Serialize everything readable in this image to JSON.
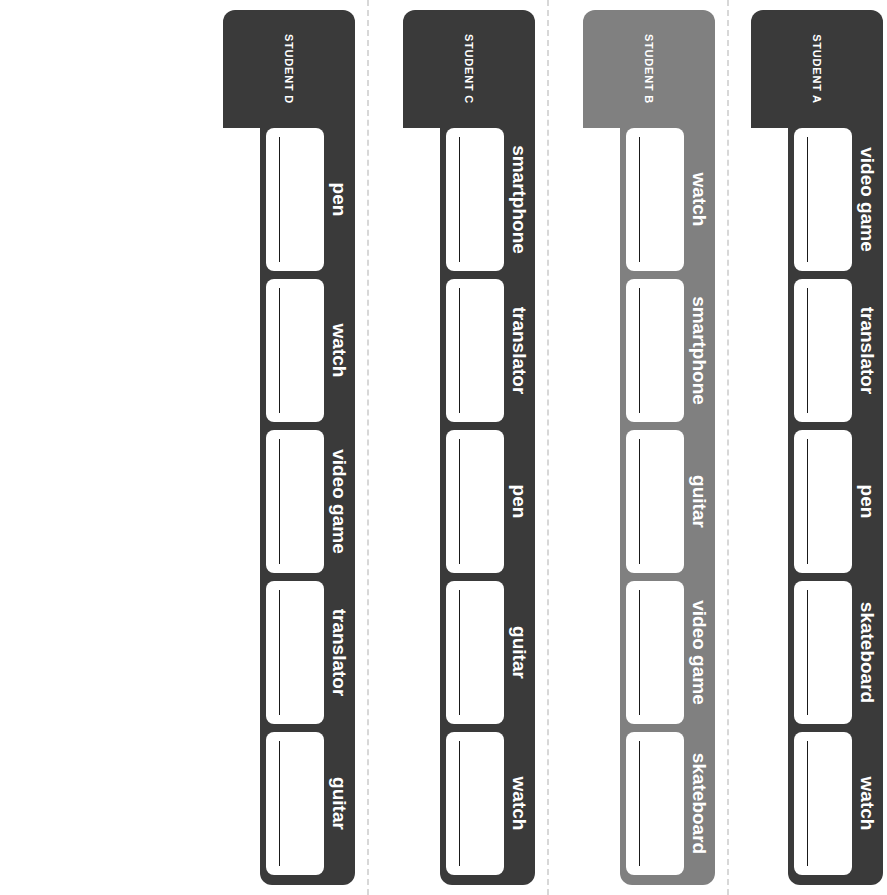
{
  "worksheet": {
    "orientation": "rotated-90",
    "background_color": "#ffffff",
    "divider_color": "#d8d8d8",
    "writebox_color": "#ffffff",
    "rule_line_color": "#1a1a1a",
    "label_color": "#ffffff"
  },
  "columns": [
    {
      "id": "student-a",
      "header": "STUDENT A",
      "color": "#3a3a3a",
      "items": [
        "video game",
        "translator",
        "pen",
        "skateboard",
        "watch"
      ]
    },
    {
      "id": "student-b",
      "header": "STUDENT B",
      "color": "#808080",
      "items": [
        "watch",
        "smartphone",
        "guitar",
        "video game",
        "skateboard"
      ]
    },
    {
      "id": "student-c",
      "header": "STUDENT C",
      "color": "#3a3a3a",
      "items": [
        "smartphone",
        "translator",
        "pen",
        "guitar",
        "watch"
      ]
    },
    {
      "id": "student-d",
      "header": "STUDENT D",
      "color": "#3a3a3a",
      "items": [
        "pen",
        "watch",
        "video game",
        "translator",
        "guitar"
      ]
    }
  ]
}
